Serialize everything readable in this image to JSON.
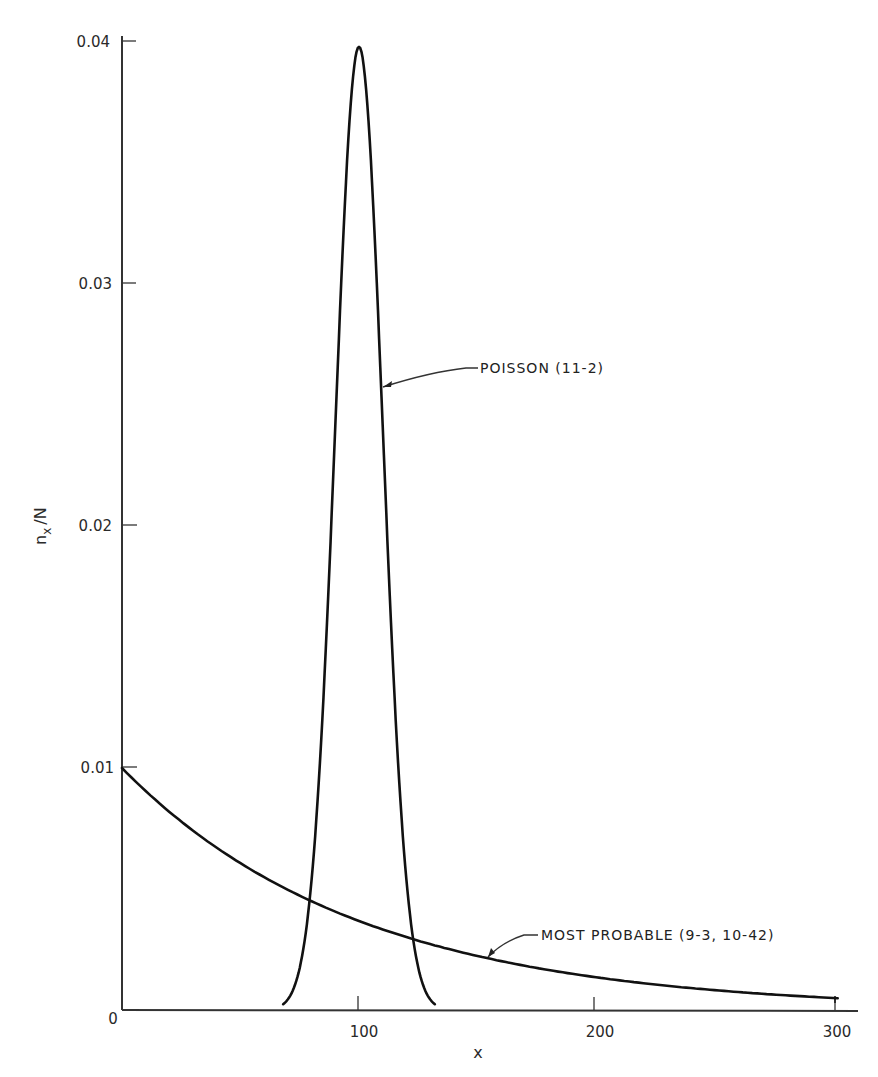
{
  "chart_data": {
    "type": "line",
    "title": "",
    "xlabel": "x",
    "ylabel": "n_x / N",
    "xlim": [
      0,
      310
    ],
    "ylim": [
      0,
      0.04
    ],
    "grid": false,
    "legend": "none (direct curve annotations)",
    "x_ticks": [
      "0",
      "100",
      "200",
      "300"
    ],
    "y_ticks": [
      "0.01",
      "0.02",
      "0.03",
      "0.04"
    ],
    "origin_label": "0",
    "series": [
      {
        "name": "POISSON (11-2)",
        "description": "Narrow peak centered at x = 100",
        "x": [
          68,
          75,
          80,
          85,
          90,
          95,
          100,
          105,
          110,
          115,
          120,
          125,
          132
        ],
        "y": [
          0.0003,
          0.002,
          0.0045,
          0.011,
          0.024,
          0.035,
          0.0398,
          0.035,
          0.024,
          0.013,
          0.0054,
          0.0028,
          0.0004
        ]
      },
      {
        "name": "MOST PROBABLE (9-3, 10-42)",
        "description": "Exponentially decaying distribution",
        "x": [
          0,
          25,
          50,
          80,
          100,
          125,
          150,
          200,
          250,
          300
        ],
        "y": [
          0.01,
          0.0078,
          0.0061,
          0.0045,
          0.0037,
          0.0029,
          0.0022,
          0.0014,
          0.0008,
          0.0005
        ]
      }
    ],
    "annotations": [
      {
        "text": "POISSON (11-2)",
        "points_to_x": 111,
        "points_to_y": 0.0258
      },
      {
        "text": "MOST PROBABLE (9-3, 10-42)",
        "points_to_x": 153,
        "points_to_y": 0.0023
      }
    ]
  },
  "labels": {
    "ylabel_main": "n",
    "ylabel_sub": "x",
    "ylabel_rest": "/N",
    "xlabel": "x",
    "origin": "0",
    "xticks": [
      "100",
      "200",
      "300"
    ],
    "yticks": [
      "0.01",
      "0.02",
      "0.03",
      "0.04"
    ],
    "poisson_label": "POISSON (11-2)",
    "mostprob_label": "MOST PROBABLE (9-3, 10-42)"
  }
}
